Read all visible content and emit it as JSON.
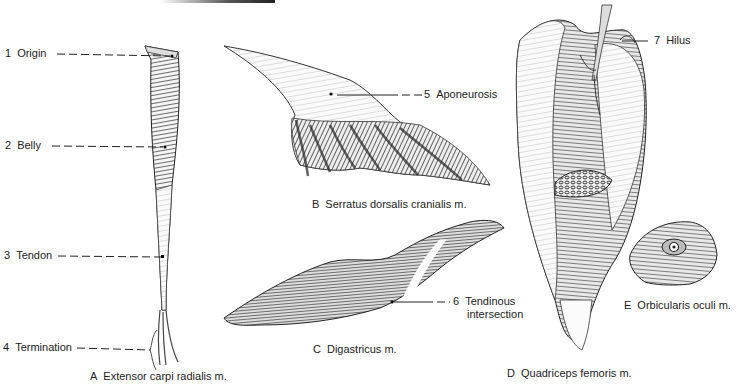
{
  "figure": {
    "panels": [
      {
        "letter": "A",
        "caption": "Extensor carpi radialis m."
      },
      {
        "letter": "B",
        "caption": "Serratus dorsalis cranialis m."
      },
      {
        "letter": "C",
        "caption": "Digastricus m."
      },
      {
        "letter": "D",
        "caption": "Quadriceps femoris m."
      },
      {
        "letter": "E",
        "caption": "Orbicularis oculi m."
      }
    ],
    "labels": [
      {
        "num": "1",
        "text": "Origin"
      },
      {
        "num": "2",
        "text": "Belly"
      },
      {
        "num": "3",
        "text": "Tendon"
      },
      {
        "num": "4",
        "text": "Termination"
      },
      {
        "num": "5",
        "text": "Aponeurosis"
      },
      {
        "num": "6",
        "text": "Tendinous",
        "text2": "intersection"
      },
      {
        "num": "7",
        "text": "Hilus"
      }
    ]
  },
  "colors": {
    "ink": "#222222",
    "shade": "#555555",
    "paper": "#ffffff"
  }
}
